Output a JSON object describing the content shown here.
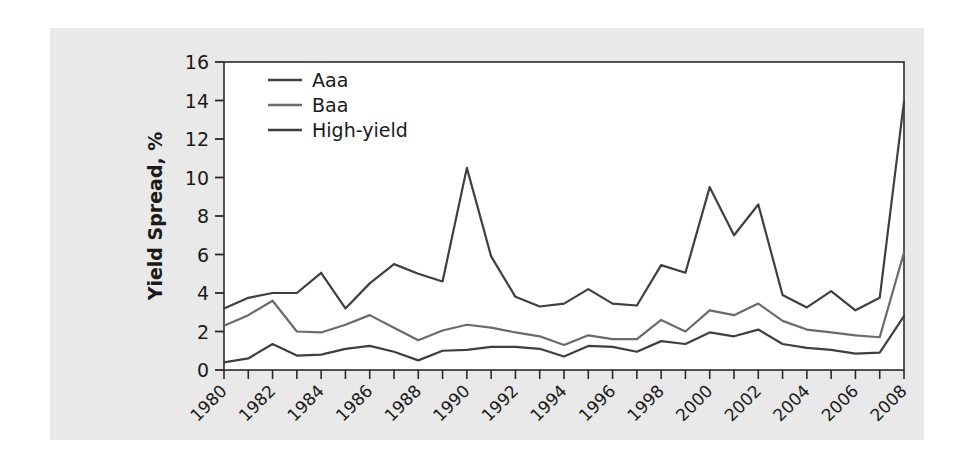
{
  "chart_data": {
    "type": "line",
    "title": "",
    "xlabel": "",
    "ylabel": "Yield Spread, %",
    "xlim": [
      1980,
      2008
    ],
    "ylim": [
      0,
      16
    ],
    "yticks": [
      0,
      2,
      4,
      6,
      8,
      10,
      12,
      14,
      16
    ],
    "xticks": [
      1980,
      1981,
      1982,
      1983,
      1984,
      1985,
      1986,
      1987,
      1988,
      1989,
      1990,
      1991,
      1992,
      1993,
      1994,
      1995,
      1996,
      1997,
      1998,
      1999,
      2000,
      2001,
      2002,
      2003,
      2004,
      2005,
      2006,
      2007,
      2008
    ],
    "xtick_labels": [
      "1980",
      "",
      "1982",
      "",
      "1984",
      "",
      "1986",
      "",
      "1988",
      "",
      "1990",
      "",
      "1992",
      "",
      "1994",
      "",
      "1996",
      "",
      "1998",
      "",
      "2000",
      "",
      "2002",
      "",
      "2004",
      "",
      "2006",
      "",
      "2008"
    ],
    "xtick_label_rotation": 45,
    "grid": false,
    "legend_position": "upper-left",
    "x": [
      1980,
      1981,
      1982,
      1983,
      1984,
      1985,
      1986,
      1987,
      1988,
      1989,
      1990,
      1991,
      1992,
      1993,
      1994,
      1995,
      1996,
      1997,
      1998,
      1999,
      2000,
      2001,
      2002,
      2003,
      2004,
      2005,
      2006,
      2007,
      2008
    ],
    "series": [
      {
        "name": "Aaa",
        "color": "#3f3f3f",
        "values": [
          0.4,
          0.6,
          1.35,
          0.75,
          0.8,
          1.1,
          1.25,
          0.95,
          0.5,
          1.0,
          1.05,
          1.2,
          1.2,
          1.1,
          0.7,
          1.25,
          1.2,
          0.95,
          1.5,
          1.35,
          1.95,
          1.75,
          2.1,
          1.35,
          1.15,
          1.05,
          0.85,
          0.9,
          2.8
        ]
      },
      {
        "name": "Baa",
        "color": "#6a6a6a",
        "values": [
          2.3,
          2.85,
          3.6,
          2.0,
          1.95,
          2.35,
          2.85,
          2.2,
          1.55,
          2.05,
          2.35,
          2.2,
          1.95,
          1.75,
          1.3,
          1.8,
          1.6,
          1.6,
          2.6,
          2.0,
          3.1,
          2.85,
          3.45,
          2.55,
          2.1,
          1.95,
          1.8,
          1.7,
          6.1
        ]
      },
      {
        "name": "High-yield",
        "color": "#3f3f3f",
        "values": [
          3.2,
          3.75,
          4.0,
          4.0,
          5.05,
          3.2,
          4.5,
          5.5,
          5.0,
          4.6,
          10.5,
          5.9,
          3.8,
          3.3,
          3.45,
          4.2,
          3.45,
          3.35,
          5.45,
          5.05,
          9.5,
          7.0,
          8.6,
          3.9,
          3.25,
          4.1,
          3.1,
          3.75,
          13.95
        ]
      }
    ]
  },
  "legend": {
    "entries": [
      {
        "label": "Aaa"
      },
      {
        "label": "Baa"
      },
      {
        "label": "High-yield"
      }
    ]
  },
  "axes": {
    "y_title": "Yield Spread, %",
    "y_tick_labels": [
      "16",
      "14",
      "12",
      "10",
      "8",
      "6",
      "4",
      "2",
      "0"
    ]
  }
}
